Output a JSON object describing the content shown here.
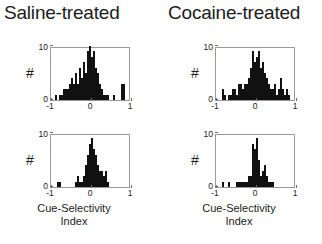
{
  "figure": {
    "columns": [
      {
        "id": "saline",
        "title": "Saline-treated"
      },
      {
        "id": "cocaine",
        "title": "Cocaine-treated"
      }
    ],
    "axis_caption_line1": "Cue-Selectivity",
    "axis_caption_line2": "Index",
    "ylabel": "#",
    "colors": {
      "black_series": "#111111",
      "gray_series": "#868686",
      "axis": "#9a9a9a",
      "text": "#1c1c1c",
      "background": "#ffffff"
    }
  },
  "chart_data": [
    {
      "id": "saline-top",
      "type": "bar",
      "title": "Saline-treated",
      "panel_row": "top",
      "panel_col": "saline",
      "xlabel": "Cue-Selectivity Index",
      "ylabel": "#",
      "xlim": [
        -1,
        1
      ],
      "ylim": [
        0,
        10
      ],
      "xticks": [
        -1,
        0,
        1
      ],
      "xtick_labels": [
        "-1",
        "0",
        "1"
      ],
      "yticks": [
        0,
        10
      ],
      "ytick_labels": [
        "0",
        "10"
      ],
      "grid": false,
      "legend": "none",
      "bin_width": 0.05,
      "bin_centers": [
        -0.875,
        -0.825,
        -0.775,
        -0.725,
        -0.675,
        -0.625,
        -0.575,
        -0.525,
        -0.475,
        -0.425,
        -0.375,
        -0.325,
        -0.275,
        -0.225,
        -0.175,
        -0.125,
        -0.075,
        -0.025,
        0.025,
        0.075,
        0.125,
        0.175,
        0.225,
        0.275,
        0.325,
        0.375,
        0.425,
        0.475,
        0.525,
        0.575,
        0.625,
        0.675,
        0.725,
        0.775,
        0.825,
        0.875
      ],
      "series": [
        {
          "name": "black",
          "color": "#111111",
          "values": [
            1,
            0,
            1,
            1,
            2,
            2,
            2,
            3,
            4,
            3,
            5,
            3,
            6,
            4,
            7,
            5,
            9,
            10,
            8,
            9,
            6,
            5,
            3,
            2,
            1,
            1,
            1,
            0,
            0,
            1,
            0,
            0,
            0,
            3,
            3,
            0
          ]
        },
        {
          "name": "gray",
          "color": "#868686",
          "values": [
            1,
            0,
            1,
            1,
            2,
            2,
            2,
            3,
            3,
            3,
            4,
            3,
            4,
            4,
            4,
            4,
            4,
            3,
            3,
            3,
            2,
            2,
            2,
            1,
            1,
            1,
            1,
            0,
            0,
            1,
            0,
            0,
            0,
            1,
            1,
            0
          ]
        }
      ]
    },
    {
      "id": "cocaine-top",
      "type": "bar",
      "title": "Cocaine-treated",
      "panel_row": "top",
      "panel_col": "cocaine",
      "xlabel": "Cue-Selectivity Index",
      "ylabel": "#",
      "xlim": [
        -1,
        1
      ],
      "ylim": [
        0,
        10
      ],
      "xticks": [
        -1,
        0,
        1
      ],
      "xtick_labels": [
        "-1",
        "0",
        "1"
      ],
      "yticks": [
        0,
        10
      ],
      "ytick_labels": [
        "0",
        "10"
      ],
      "grid": false,
      "legend": "none",
      "bin_width": 0.05,
      "bin_centers": [
        -0.875,
        -0.825,
        -0.775,
        -0.725,
        -0.675,
        -0.625,
        -0.575,
        -0.525,
        -0.475,
        -0.425,
        -0.375,
        -0.325,
        -0.275,
        -0.225,
        -0.175,
        -0.125,
        -0.075,
        -0.025,
        0.025,
        0.075,
        0.125,
        0.175,
        0.225,
        0.275,
        0.325,
        0.375,
        0.425,
        0.475,
        0.525,
        0.575,
        0.625,
        0.675,
        0.725,
        0.775,
        0.825,
        0.875
      ],
      "series": [
        {
          "name": "black",
          "color": "#111111",
          "values": [
            0,
            2,
            1,
            0,
            1,
            1,
            2,
            2,
            1,
            3,
            3,
            2,
            3,
            3,
            4,
            6,
            9,
            7,
            8,
            9,
            6,
            7,
            5,
            4,
            3,
            2,
            2,
            3,
            1,
            2,
            4,
            2,
            1,
            2,
            1,
            0
          ]
        },
        {
          "name": "gray",
          "color": "#868686",
          "values": [
            0,
            1,
            1,
            0,
            1,
            1,
            2,
            2,
            1,
            2,
            2,
            2,
            2,
            2,
            3,
            3,
            3,
            3,
            3,
            4,
            3,
            4,
            3,
            3,
            2,
            2,
            2,
            2,
            1,
            2,
            2,
            2,
            1,
            2,
            1,
            0
          ]
        }
      ]
    },
    {
      "id": "saline-bottom",
      "type": "bar",
      "title": "Saline-treated",
      "panel_row": "bottom",
      "panel_col": "saline",
      "xlabel": "Cue-Selectivity Index",
      "ylabel": "#",
      "xlim": [
        -1,
        1
      ],
      "ylim": [
        0,
        10
      ],
      "xticks": [
        -1,
        0,
        1
      ],
      "xtick_labels": [
        "-1",
        "0",
        "1"
      ],
      "yticks": [
        0,
        10
      ],
      "ytick_labels": [
        "0",
        "10"
      ],
      "grid": false,
      "legend": "none",
      "bin_width": 0.05,
      "bin_centers": [
        -0.875,
        -0.825,
        -0.775,
        -0.725,
        -0.675,
        -0.625,
        -0.575,
        -0.525,
        -0.475,
        -0.425,
        -0.375,
        -0.325,
        -0.275,
        -0.225,
        -0.175,
        -0.125,
        -0.075,
        -0.025,
        0.025,
        0.075,
        0.125,
        0.175,
        0.225,
        0.275,
        0.325,
        0.375,
        0.425,
        0.475,
        0.525,
        0.575,
        0.625,
        0.675,
        0.725,
        0.775,
        0.825,
        0.875
      ],
      "series": [
        {
          "name": "black",
          "color": "#111111",
          "values": [
            0,
            1,
            1,
            0,
            0,
            0,
            0,
            0,
            0,
            0,
            1,
            2,
            1,
            1,
            2,
            4,
            6,
            8,
            9,
            7,
            6,
            4,
            3,
            3,
            2,
            3,
            1,
            0,
            0,
            0,
            0,
            0,
            0,
            0,
            0,
            0
          ]
        },
        {
          "name": "gray",
          "color": "#868686",
          "values": [
            0,
            1,
            1,
            0,
            0,
            0,
            0,
            0,
            0,
            0,
            1,
            2,
            1,
            1,
            2,
            2,
            2,
            2,
            2,
            2,
            3,
            3,
            3,
            3,
            2,
            2,
            1,
            0,
            0,
            0,
            0,
            0,
            0,
            0,
            0,
            0
          ]
        }
      ]
    },
    {
      "id": "cocaine-bottom",
      "type": "bar",
      "title": "Cocaine-treated",
      "panel_row": "bottom",
      "panel_col": "cocaine",
      "xlabel": "Cue-Selectivity Index",
      "ylabel": "#",
      "xlim": [
        -1,
        1
      ],
      "ylim": [
        0,
        10
      ],
      "xticks": [
        -1,
        0,
        1
      ],
      "xtick_labels": [
        "-1",
        "0",
        "1"
      ],
      "yticks": [
        0,
        10
      ],
      "ytick_labels": [
        "0",
        "10"
      ],
      "grid": false,
      "legend": "none",
      "bin_width": 0.05,
      "bin_centers": [
        -0.875,
        -0.825,
        -0.775,
        -0.725,
        -0.675,
        -0.625,
        -0.575,
        -0.525,
        -0.475,
        -0.425,
        -0.375,
        -0.325,
        -0.275,
        -0.225,
        -0.175,
        -0.125,
        -0.075,
        -0.025,
        0.025,
        0.075,
        0.125,
        0.175,
        0.225,
        0.275,
        0.325,
        0.375,
        0.425,
        0.475,
        0.525,
        0.575,
        0.625,
        0.675,
        0.725,
        0.775,
        0.825,
        0.875
      ],
      "series": [
        {
          "name": "black",
          "color": "#111111",
          "values": [
            0,
            1,
            0,
            0,
            1,
            0,
            0,
            0,
            1,
            1,
            1,
            1,
            1,
            1,
            2,
            2,
            8,
            7,
            9,
            5,
            2,
            3,
            4,
            2,
            1,
            1,
            1,
            0,
            0,
            0,
            0,
            0,
            0,
            0,
            0,
            0
          ]
        },
        {
          "name": "gray",
          "color": "#868686",
          "values": [
            0,
            1,
            0,
            0,
            1,
            0,
            0,
            0,
            1,
            1,
            1,
            1,
            1,
            1,
            2,
            2,
            2,
            2,
            2,
            2,
            2,
            2,
            3,
            2,
            1,
            1,
            1,
            0,
            0,
            0,
            0,
            0,
            0,
            0,
            0,
            0
          ]
        }
      ]
    }
  ]
}
